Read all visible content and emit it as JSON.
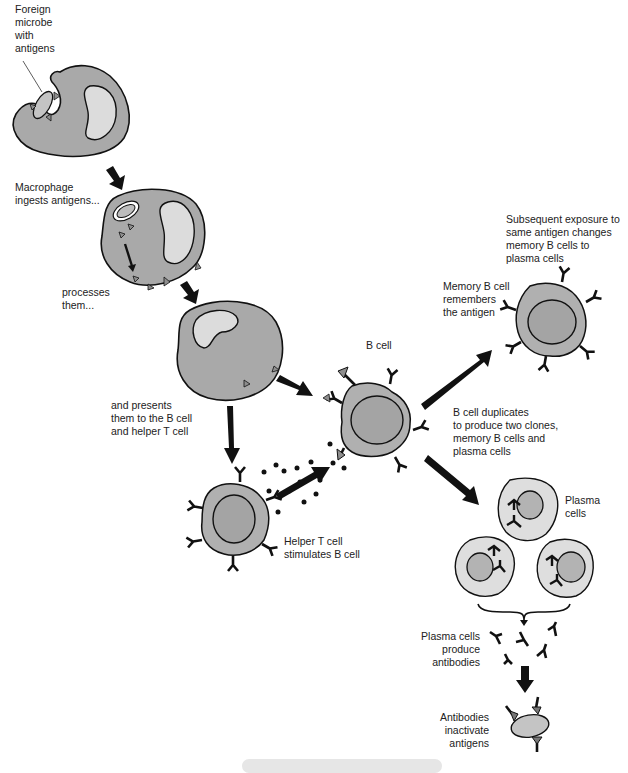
{
  "diagram": {
    "colors": {
      "cell_fill": "#a9a9a9",
      "nucleus_fill": "#dcdcdc",
      "plasma_fill": "#dedede",
      "plasma_nucleus": "#b3b3b3",
      "antigen": "#8e8e8e",
      "outline": "#111111",
      "arrow": "#111111"
    },
    "labels": {
      "foreign_microbe": [
        "Foreign",
        "microbe",
        "with",
        "antigens"
      ],
      "macrophage_ingests": [
        "Macrophage",
        "ingests antigens..."
      ],
      "processes": [
        "processes",
        "them..."
      ],
      "presents": [
        "and presents",
        "them to the B cell",
        "and helper T cell"
      ],
      "b_cell": "B cell",
      "helper_t": [
        "Helper T cell",
        "stimulates B cell"
      ],
      "duplicates": [
        "B cell duplicates",
        "to produce two clones,",
        "memory B cells and",
        "plasma cells"
      ],
      "subsequent": [
        "Subsequent exposure to",
        "same antigen changes",
        "memory B cells to",
        "plasma cells"
      ],
      "memory_b": [
        "Memory B cell",
        "remembers",
        "the antigen"
      ],
      "plasma_cells": [
        "Plasma",
        "cells"
      ],
      "produce_antibodies": [
        "Plasma cells",
        "produce",
        "antibodies"
      ],
      "inactivate": [
        "Antibodies",
        "inactivate",
        "antigens"
      ]
    },
    "stages": [
      "Foreign microbe with antigens",
      "Macrophage ingests antigens",
      "Processes them",
      "Presents them to the B cell and helper T cell",
      "Helper T cell stimulates B cell",
      "B cell duplicates to produce two clones",
      "Memory B cell remembers the antigen",
      "Plasma cells produce antibodies",
      "Antibodies inactivate antigens"
    ]
  }
}
